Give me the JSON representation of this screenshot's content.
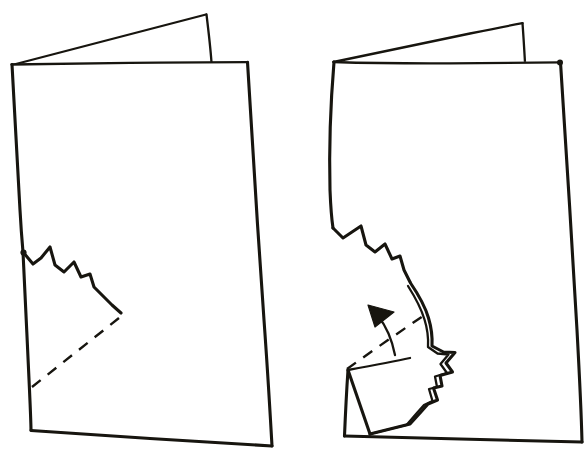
{
  "document": {
    "title": "Folded paper tearing instruction diagram",
    "background_color": "#ffffff",
    "ink_color": "#17150f",
    "width": 587,
    "height": 463,
    "style": "hand-drawn black ink line art, no text labels"
  },
  "figures": [
    {
      "id": "figure-left",
      "name": "folded-card-before",
      "caption": "",
      "description": "Upright folded sheet of paper seen from the front, back panel angled behind, with a torn zigzag notch on the lower left edge and a dashed diagonal fold line",
      "parts": {
        "front_panel": "large quadrilateral front face",
        "back_panel": "thin wedge of the back panel visible above the fold",
        "torn_edge": "jagged zigzag tear running from the left edge down and to the right",
        "fold_line": "dashed diagonal crease from lower left to the end of the tear"
      },
      "geometry": {
        "front_panel_corners": [
          [
            11,
            64
          ],
          [
            248,
            62
          ],
          [
            272,
            446
          ],
          [
            31,
            430
          ]
        ],
        "back_panel_points": [
          [
            11,
            64
          ],
          [
            207,
            14
          ],
          [
            212,
            62
          ]
        ],
        "zigzag_points": [
          [
            23,
            252
          ],
          [
            33,
            264
          ],
          [
            41,
            258
          ],
          [
            50,
            247
          ],
          [
            55,
            265
          ],
          [
            64,
            272
          ],
          [
            74,
            262
          ],
          [
            81,
            277
          ],
          [
            90,
            274
          ],
          [
            94,
            287
          ],
          [
            104,
            297
          ],
          [
            112,
            305
          ],
          [
            121,
            313
          ]
        ],
        "fold_line_start": [
          32,
          387
        ],
        "fold_line_end": [
          124,
          314
        ]
      }
    },
    {
      "id": "figure-right",
      "name": "folded-card-after",
      "caption": "",
      "description": "Same folded sheet with the torn flap folded upward along the dashed crease; a solid curved arrow points up and to the left showing the direction of the fold",
      "parts": {
        "front_panel": "large quadrilateral front face",
        "back_panel": "thin wedge of the back panel visible above the fold",
        "torn_edge": "jagged zigzag tear running down the middle of the panel",
        "folded_flap": "triangular flap folded over, doubled outline shows the thickness of the paper",
        "fold_line": "dashed crease across the folded flap",
        "motion_arrow": "solid filled triangular arrowhead on a curved shaft indicating the fold direction"
      },
      "geometry": {
        "front_panel_corners": [
          [
            333,
            61
          ],
          [
            561,
            62
          ],
          [
            582,
            442
          ],
          [
            344,
            436
          ]
        ],
        "back_panel_points": [
          [
            333,
            61
          ],
          [
            523,
            23
          ],
          [
            525,
            62
          ]
        ],
        "zigzag_points": [
          [
            333,
            228
          ],
          [
            343,
            238
          ],
          [
            352,
            232
          ],
          [
            361,
            226
          ],
          [
            366,
            245
          ],
          [
            375,
            252
          ],
          [
            385,
            244
          ],
          [
            392,
            259
          ],
          [
            400,
            256
          ],
          [
            404,
            270
          ],
          [
            410,
            282
          ]
        ],
        "flap_corner_bottom": [
          370,
          434
        ],
        "arrow_tip": [
          368,
          308
        ],
        "arrow_tail": [
          395,
          340
        ]
      }
    }
  ],
  "annotations": {
    "arrow_count": 1,
    "dashed_fold_lines": 2,
    "torn_zigzag_edges": 2,
    "text_labels": []
  }
}
